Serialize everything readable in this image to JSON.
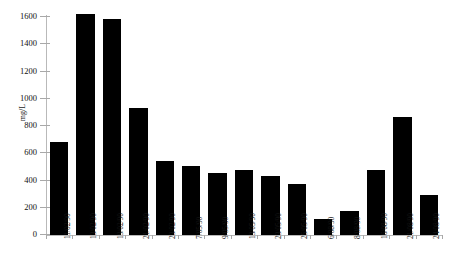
{
  "chart_data": {
    "type": "bar",
    "title": "",
    "xlabel": "",
    "ylabel": "mg/L",
    "ylim": [
      0,
      1600
    ],
    "yticks": [
      0,
      200,
      400,
      600,
      800,
      1000,
      1200,
      1400,
      1600
    ],
    "ytick_labels": [
      "0",
      "200",
      "400",
      "600",
      "800",
      "1000",
      "1200",
      "1400",
      "1600"
    ],
    "grid": false,
    "legend": null,
    "bar_color": "#000000",
    "axis_color": "#b9b9b9",
    "categories": [
      "11/02/90",
      "13/02/90",
      "19/02/90",
      "21/02/90",
      "23/02/90",
      "7/05/90",
      "9/05/90",
      "13/05/90",
      "23/05/90",
      "25/05/90",
      "6/08/90",
      "8/08/90",
      "16/08/90",
      "21/08/90",
      "24/08/90"
    ],
    "values": [
      680,
      1620,
      1585,
      935,
      540,
      505,
      455,
      480,
      430,
      375,
      115,
      175,
      480,
      865,
      295
    ]
  }
}
